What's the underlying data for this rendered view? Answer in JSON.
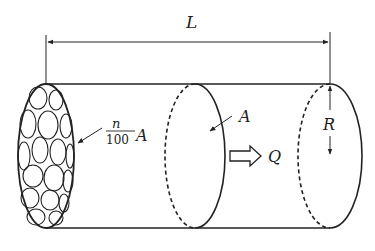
{
  "diagram": {
    "labels": {
      "length": "L",
      "radius": "R",
      "area": "A",
      "porous_area_numerator": "n",
      "porous_area_denominator": "100",
      "porous_area_symbol": "A",
      "flow": "Q"
    },
    "colors": {
      "stroke": "#222222",
      "background": "#ffffff"
    }
  }
}
